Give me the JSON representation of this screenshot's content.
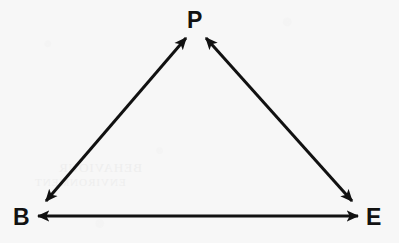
{
  "diagram": {
    "type": "triangle-relationship-diagram",
    "background_color": "#f7f7f7",
    "stroke_color": "#111111",
    "stroke_width": 3,
    "nodes": [
      {
        "id": "P",
        "label": "P",
        "x": 196,
        "y": 20,
        "role": "apex"
      },
      {
        "id": "B",
        "label": "B",
        "x": 22,
        "y": 217,
        "role": "bottom-left"
      },
      {
        "id": "E",
        "label": "E",
        "x": 375,
        "y": 217,
        "role": "bottom-right"
      }
    ],
    "edges": [
      {
        "id": "edge-b-p",
        "from": "B",
        "to": "P",
        "direction": "bidirectional",
        "label": ""
      },
      {
        "id": "edge-p-e",
        "from": "P",
        "to": "E",
        "direction": "bidirectional",
        "label": ""
      },
      {
        "id": "edge-b-e",
        "from": "B",
        "to": "E",
        "direction": "bidirectional",
        "label": ""
      }
    ],
    "artifacts": {
      "bleed_through_upper": "BEHAVIOUR",
      "bleed_through_lower": "ENVIRONMENT"
    }
  }
}
